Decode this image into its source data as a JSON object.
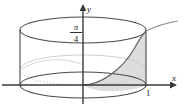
{
  "figure": {
    "background_color": "#ffffff",
    "width": 187,
    "height": 109
  },
  "axes": {
    "x_axis": {
      "label": "x",
      "label_x": 176,
      "label_y": 80,
      "line_from_x": 2,
      "line_to_x": 172,
      "line_y": 85,
      "color": "#3a3a3a",
      "arrow": "right"
    },
    "y_axis": {
      "label": "y",
      "label_x": 90,
      "label_y": 11,
      "line_x": 83,
      "line_from_y": 104,
      "line_to_y": 7,
      "color": "#3a3a3a",
      "arrow": "up"
    }
  },
  "ticks": [
    {
      "name": "x-tick-one",
      "label": "1",
      "x": 149,
      "y": 95,
      "axis": "x"
    }
  ],
  "annotations": [
    {
      "name": "pi-over-four-label",
      "numerator": "π",
      "denominator": "4",
      "x": 76,
      "num_y": 29,
      "bar_y": 32,
      "den_y": 42,
      "bar_from_x": 69,
      "bar_to_x": 83,
      "description": "Height of cylinder marked as pi over 4 on the y axis"
    }
  ],
  "cylinder": {
    "left_edge_x": 20,
    "right_edge_x": 146,
    "center_x": 83,
    "top_ellipse_cy": 30,
    "bottom_ellipse_cy": 85,
    "rx": 63,
    "ry": 13,
    "outline_color": "#4a4a4a",
    "outline_width": 1.1,
    "faint_color": "#b8b8b8",
    "fill": "none"
  },
  "shaded_region": {
    "name": "curved-surface-region",
    "fill_color": "#d4d4d4",
    "fill_opacity": 0.75,
    "edge_color": "#6a6a6a",
    "description": "Region between the rising curve and the base ellipse on the right half of the cylinder"
  },
  "curve": {
    "name": "rising-curve",
    "color": "#6a6a6a",
    "width": 1.2,
    "start_x": 83,
    "start_y": 85,
    "end_x": 178,
    "end_y": 21,
    "description": "Curve rising from origin through the cylinder wall and extending beyond to upper right"
  },
  "inner_ellipse": {
    "name": "base-circle-perspective",
    "color": "#c0c0c0",
    "dashed": true,
    "cy": 70,
    "rx": 63,
    "ry": 15
  }
}
